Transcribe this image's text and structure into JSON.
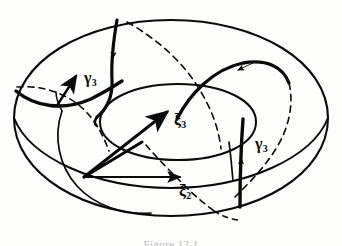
{
  "figure": {
    "kind": "hand-drawn-torus-diagram",
    "background_color": "#fdfdfc",
    "ink_color": "#0a0a0a",
    "caption": "Figure 13.1",
    "caption_color": "#b9b9b7"
  },
  "labels": {
    "gamma3_left": {
      "symbol": "γ",
      "subscript": "3"
    },
    "gamma3_right": {
      "symbol": "γ",
      "subscript": "3"
    },
    "xi3": {
      "symbol": "ξ",
      "subscript": "3"
    },
    "xi2": {
      "symbol": "ξ",
      "subscript": "2"
    }
  },
  "geometry": {
    "outer_silhouette": "M 14 118 C 14 62 84 20 171 20 C 258 20 328 62 328 118 C 328 174 258 216 171 216 C 84 216 14 174 14 118 Z",
    "lower_profile": "M 14 118 C 30 158 96 188 171 188 C 246 188 312 158 328 118",
    "inner_hole_top": "M 100 122 C 100 100 134 84 178 84 C 222 84 256 100 256 122 C 256 144 222 160 178 160 C 134 160 100 144 100 122 Z",
    "meridian_left": "M 62 112 C 54 138 60 166 78 186 C 96 206 124 214 150 212",
    "inner_wall_right": "M 229 143 C 231 158 232 170 233 182",
    "gamma_near_vertical": "M 116 20 C 112 44 110 62 112 82 C 114 100 106 112 98 118",
    "gamma_left_hook": "M 16 92 C 36 108 64 112 92 100 C 110 92 122 84 136 76",
    "gamma_upper_right": "M 178 120 C 190 96 214 70 244 64 C 268 60 284 68 290 84",
    "gamma_right_vertical": "M 243 120 C 241 148 240 176 240 206",
    "dashed_left": "M 18 88 C 44 86 66 94 82 108 C 96 120 104 136 110 152",
    "dashed_top_right": "M 128 22 C 160 40 186 64 202 92 C 214 112 220 132 222 150",
    "dashed_right_descend": "M 290 84 C 294 104 290 126 278 146 C 266 166 250 182 236 196",
    "dashed_center_low": "M 146 146 C 158 160 172 174 186 188 C 196 198 206 206 216 212"
  },
  "arrows": {
    "gamma_left_arrow": {
      "direction": "right",
      "tip_x": 80,
      "tip_y": 74
    },
    "gamma_top_arrow": {
      "direction": "down",
      "tip_x": 112,
      "tip_y": 62
    },
    "gamma_upper_right_arrow": {
      "direction": "down-left",
      "tip_x": 238,
      "tip_y": 72
    },
    "gamma_right_arrow": {
      "direction": "up",
      "tip_x": 241,
      "tip_y": 156
    },
    "xi3_arrow": {
      "direction": "up-right",
      "tip_x": 170,
      "tip_y": 110,
      "tail_x": 84,
      "tail_y": 177
    },
    "xi2_arrow": {
      "direction": "right",
      "tip_x": 184,
      "tip_y": 177,
      "tail_x": 84,
      "tail_y": 177
    }
  },
  "basepoint": {
    "x": 84,
    "y": 177
  }
}
